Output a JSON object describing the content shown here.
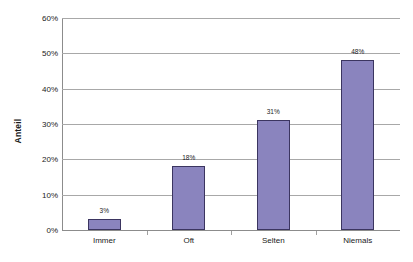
{
  "chart_data": {
    "type": "bar",
    "title": "",
    "subtitle": "",
    "xlabel": "",
    "ylabel": "Anteil",
    "categories": [
      "Immer",
      "Oft",
      "Selten",
      "Niemals"
    ],
    "values": [
      3,
      18,
      31,
      48
    ],
    "data_labels": [
      "3%",
      "18%",
      "31%",
      "48%"
    ],
    "ylim": [
      0,
      60
    ],
    "ytick_values": [
      0,
      10,
      20,
      30,
      40,
      50,
      60
    ],
    "ytick_labels": [
      "0%",
      "10%",
      "20%",
      "30%",
      "40%",
      "50%",
      "60%"
    ],
    "grid": true,
    "legend": false,
    "legend_position": "none",
    "series": [
      {
        "name": "Anteil",
        "values": [
          3,
          18,
          31,
          48
        ],
        "color": "#8a84be",
        "border_color": "#3b3560"
      }
    ],
    "colors": {
      "bar_fill": "#8a84be",
      "bar_border": "#3b3560",
      "gridline": "#a8a8a8",
      "axis": "#8c8c8c",
      "text": "#1a1a1a",
      "background": "#ffffff"
    }
  }
}
